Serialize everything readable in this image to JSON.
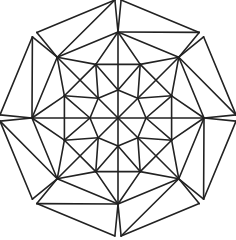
{
  "diagram": {
    "title": "",
    "type": "8-fold geometric star pattern",
    "center": [
      118,
      118
    ],
    "symmetry": 8,
    "stroke_color": "#222222",
    "background": "#ffffff",
    "radii": {
      "outer_tip": 118,
      "vertex_ring": 86,
      "mid_ring": 58,
      "inner_octagon": 28
    },
    "angles": {
      "vertex_offset_deg": -90,
      "outer_tip_spread_deg": 21,
      "mid_ring_offset_deg": 22.5
    }
  }
}
